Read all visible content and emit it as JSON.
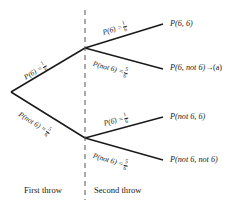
{
  "diagram": {
    "line_color": "#1a1a1a",
    "divider_color": "#555555",
    "background": "#ffffff"
  },
  "branches": {
    "first_throw_six": {
      "prefix": "P(6) =",
      "numerator": "1",
      "denominator": "6"
    },
    "first_throw_not_six": {
      "prefix": "P(not 6) =",
      "numerator": "5",
      "denominator": "6"
    },
    "second_throw_six_upper": {
      "prefix": "P(6) =",
      "numerator": "1",
      "denominator": "6"
    },
    "second_throw_not_six_upper": {
      "prefix": "P(not 6) =",
      "numerator": "5",
      "denominator": "6"
    },
    "second_throw_six_lower": {
      "prefix": "P(6) =",
      "numerator": "1",
      "denominator": "6"
    },
    "second_throw_not_six_lower": {
      "prefix": "P(not 6) =",
      "numerator": "5",
      "denominator": "6"
    }
  },
  "outcomes": {
    "six_six": "P(6, 6)",
    "six_not_six": "P(6, not 6)",
    "six_not_six_arrow": "→",
    "six_not_six_annotation": "(a)",
    "not_six_six": "P(not 6, 6)",
    "not_six_not_six": "P(not 6, not 6)"
  },
  "stages": {
    "first": "First throw",
    "second": "Second throw"
  }
}
